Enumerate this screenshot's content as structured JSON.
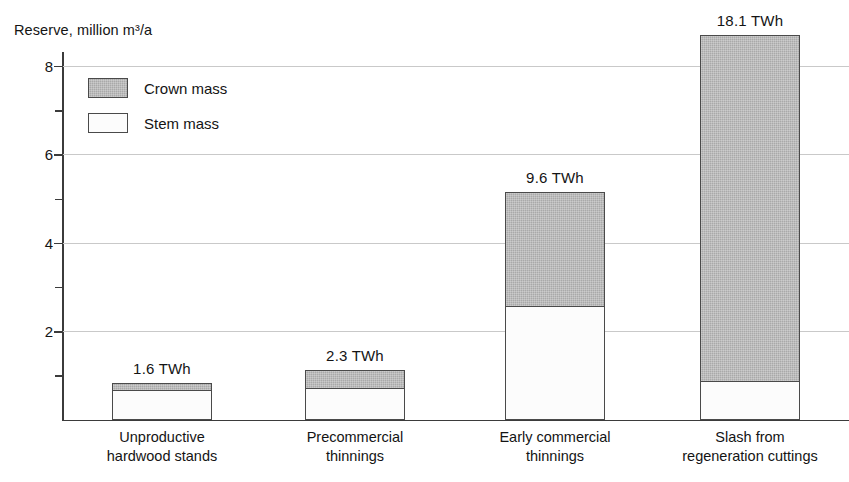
{
  "chart_data": {
    "type": "bar",
    "subtype": "stacked-vertical",
    "title": "",
    "ylabel": "Reserve, million m³/a",
    "xlabel": "",
    "ylim": [
      0,
      8.9
    ],
    "yticks": [
      2,
      4,
      6,
      8
    ],
    "ytick_labels": [
      "2",
      "4",
      "6",
      "8"
    ],
    "yminor_ticks": [
      1,
      3,
      5,
      7
    ],
    "grid": "horizontal",
    "legend_position": "upper-left-inside",
    "categories": [
      "Unproductive hardwood stands",
      "Precommercial thinnings",
      "Early commercial thinnings",
      "Slash from regeneration cuttings"
    ],
    "category_lines": [
      [
        "Unproductive",
        "hardwood stands"
      ],
      [
        "Precommercial",
        "thinnings"
      ],
      [
        "Early commercial",
        "thinnings"
      ],
      [
        "Slash from",
        "regeneration cuttings"
      ]
    ],
    "series": [
      {
        "name": "Stem mass",
        "color": "#fcfcfc",
        "values": [
          0.68,
          0.72,
          2.58,
          0.87
        ]
      },
      {
        "name": "Crown mass",
        "color": "#a9a9a9",
        "values": [
          0.14,
          0.4,
          2.57,
          7.83
        ]
      }
    ],
    "totals": [
      0.82,
      1.12,
      5.15,
      8.7
    ],
    "annotations": [
      "1.6  TWh",
      "2.3  TWh",
      "9.6  TWh",
      "18.1  TWh"
    ],
    "annotation_values": [
      1.6,
      2.3,
      9.6,
      18.1
    ],
    "annotation_unit": "TWh"
  },
  "axis": {
    "y_title": "Reserve, million m³/a",
    "tick_0": "2",
    "tick_1": "4",
    "tick_2": "6",
    "tick_3": "8"
  },
  "legend": {
    "items": [
      {
        "label": "Crown mass",
        "swatch": "crown"
      },
      {
        "label": "Stem mass",
        "swatch": "stem"
      }
    ]
  },
  "bars": [
    {
      "category_line_1": "Unproductive",
      "category_line_2": "hardwood stands",
      "value_label": "1.6  TWh"
    },
    {
      "category_line_1": "Precommercial",
      "category_line_2": "thinnings",
      "value_label": "2.3  TWh"
    },
    {
      "category_line_1": "Early commercial",
      "category_line_2": "thinnings",
      "value_label": "9.6  TWh"
    },
    {
      "category_line_1": "Slash from",
      "category_line_2": "regeneration cuttings",
      "value_label": "18.1  TWh"
    }
  ]
}
